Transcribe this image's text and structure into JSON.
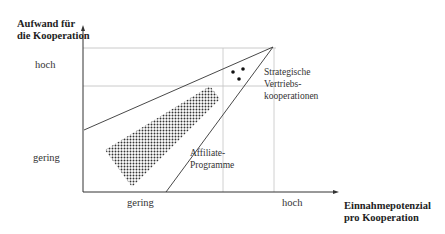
{
  "diagram": {
    "y_axis": {
      "title_line1": "Aufwand für",
      "title_line2": "die Kooperation",
      "tick_high": "hoch",
      "tick_low": "gering"
    },
    "x_axis": {
      "title_line1": "Einnahmepotenzial",
      "title_line2": "pro Kooperation",
      "tick_low": "gering",
      "tick_high": "hoch"
    },
    "regions": {
      "strategic": {
        "line1": "Strategische",
        "line2": "Vertriebs-",
        "line3": "kooperationen"
      },
      "affiliate": {
        "line1": "Affiliate-",
        "line2": "Programme"
      }
    },
    "colors": {
      "lines": "#333333",
      "gridlines": "#b8b8b8",
      "band": "#444444"
    }
  }
}
